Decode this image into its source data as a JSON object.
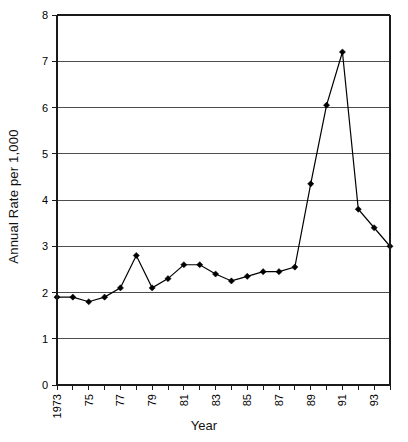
{
  "chart_data": {
    "type": "line",
    "title": "",
    "xlabel": "Year",
    "ylabel": "Annual Rate per 1,000",
    "ylim": [
      0,
      8
    ],
    "xlim": [
      1973,
      1994
    ],
    "grid": true,
    "legend": "none",
    "y_ticks": [
      "0",
      "1",
      "2",
      "3",
      "4",
      "5",
      "6",
      "7",
      "8"
    ],
    "y_tick_values": [
      0,
      1,
      2,
      3,
      4,
      5,
      6,
      7,
      8
    ],
    "x_tick_labels": [
      "1973",
      "75",
      "77",
      "79",
      "81",
      "83",
      "85",
      "87",
      "89",
      "91",
      "93"
    ],
    "x_tick_values": [
      1973,
      1975,
      1977,
      1979,
      1981,
      1983,
      1985,
      1987,
      1989,
      1991,
      1993
    ],
    "x": [
      1973,
      1974,
      1975,
      1976,
      1977,
      1978,
      1979,
      1980,
      1981,
      1982,
      1983,
      1984,
      1985,
      1986,
      1987,
      1988,
      1989,
      1990,
      1991,
      1992,
      1993,
      1994
    ],
    "values": [
      1.9,
      1.9,
      1.8,
      1.9,
      2.1,
      2.8,
      2.1,
      2.3,
      2.6,
      2.6,
      2.4,
      2.25,
      2.35,
      2.45,
      2.45,
      2.55,
      4.35,
      6.05,
      7.2,
      3.8,
      3.4,
      3.0
    ],
    "series": [
      {
        "name": "Annual Rate per 1,000",
        "marker": "diamond",
        "color": "#000000",
        "values": [
          1.9,
          1.9,
          1.8,
          1.9,
          2.1,
          2.8,
          2.1,
          2.3,
          2.6,
          2.6,
          2.4,
          2.25,
          2.35,
          2.45,
          2.45,
          2.55,
          4.35,
          6.05,
          7.2,
          3.8,
          3.4,
          3.0
        ]
      }
    ]
  },
  "axes": {
    "y_title": "Annual Rate per 1,000",
    "x_title": "Year"
  }
}
